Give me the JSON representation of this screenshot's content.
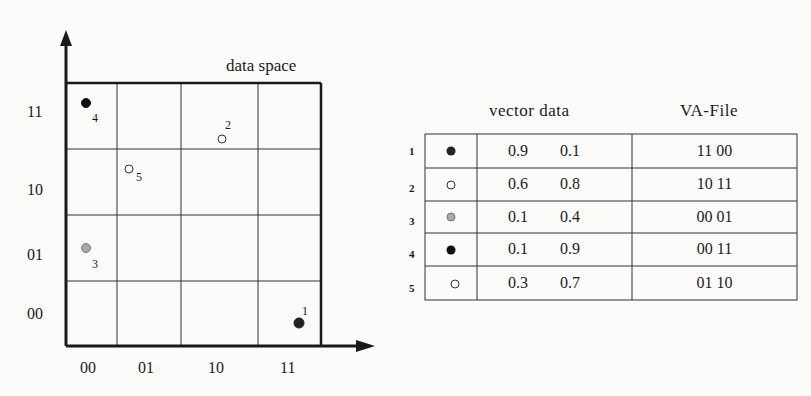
{
  "diagram": {
    "title": "data space",
    "y_axis_labels": [
      "11",
      "10",
      "01",
      "00"
    ],
    "x_axis_labels": [
      "00",
      "01",
      "10",
      "11"
    ],
    "points": [
      {
        "id": "1",
        "label": "1",
        "fill": "#222222",
        "stroke": "#222222",
        "x": 0.9,
        "y": 0.1
      },
      {
        "id": "2",
        "label": "2",
        "fill": "#ffffff",
        "stroke": "#333333",
        "x": 0.6,
        "y": 0.8
      },
      {
        "id": "3",
        "label": "3",
        "fill": "#a8a8a8",
        "stroke": "#777777",
        "x": 0.1,
        "y": 0.4
      },
      {
        "id": "4",
        "label": "4",
        "fill": "#111111",
        "stroke": "#111111",
        "x": 0.1,
        "y": 0.9
      },
      {
        "id": "5",
        "label": "5",
        "fill": "#ffffff",
        "stroke": "#333333",
        "x": 0.3,
        "y": 0.7
      }
    ]
  },
  "table": {
    "headers": {
      "vector": "vector data",
      "vafile": "VA-File"
    },
    "rows": [
      {
        "num": "1",
        "v1": "0.9",
        "v2": "0.1",
        "va": "11 00"
      },
      {
        "num": "2",
        "v1": "0.6",
        "v2": "0.8",
        "va": "10 11"
      },
      {
        "num": "3",
        "v1": "0.1",
        "v2": "0.4",
        "va": "00 01"
      },
      {
        "num": "4",
        "v1": "0.1",
        "v2": "0.9",
        "va": "00 11"
      },
      {
        "num": "5",
        "v1": "0.3",
        "v2": "0.7",
        "va": "01 10"
      }
    ]
  }
}
